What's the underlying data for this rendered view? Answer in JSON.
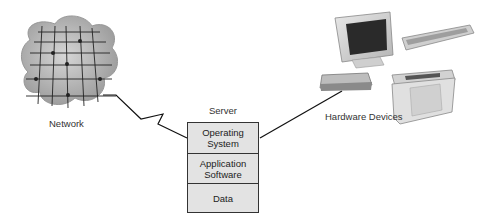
{
  "labels": {
    "network": "Network",
    "server": "Server",
    "hardware": "Hardware Devices"
  },
  "server_layers": [
    {
      "line1": "Operating",
      "line2": "System"
    },
    {
      "line1": "Application",
      "line2": "Software"
    },
    {
      "line1": "Data",
      "line2": ""
    }
  ],
  "colors": {
    "box_fill": "#e3e3e3",
    "stroke": "#222222",
    "cloud": "#a8a8a8"
  }
}
